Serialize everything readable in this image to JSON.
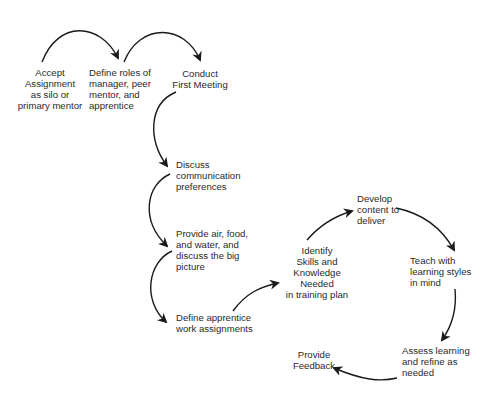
{
  "diagram": {
    "type": "process-flow",
    "line_color": "#1a1a1a",
    "nodes": [
      {
        "id": "accept",
        "label": "Accept\nAssignment\nas silo or\nprimary mentor"
      },
      {
        "id": "define-roles",
        "label": "Define roles of\nmanager, peer\nmentor, and\napprentice"
      },
      {
        "id": "first-meeting",
        "label": "Conduct\nFirst Meeting"
      },
      {
        "id": "communication",
        "label": "Discuss\ncommunication\npreferences"
      },
      {
        "id": "air-food-water",
        "label": "Provide air, food,\nand water, and\ndiscuss the big\npicture"
      },
      {
        "id": "work-assignments",
        "label": "Define apprentice\nwork assignments"
      },
      {
        "id": "identify-skills",
        "label": "Identify\nSkills and\nKnowledge\nNeeded\nin training plan"
      },
      {
        "id": "develop-content",
        "label": "Develop\ncontent to\ndeliver"
      },
      {
        "id": "teach",
        "label": "Teach with\nlearning styles\nin mind"
      },
      {
        "id": "assess",
        "label": "Assess learning\nand refine as\nneeded"
      },
      {
        "id": "feedback",
        "label": "Provide\nFeedback"
      }
    ],
    "edges": [
      {
        "from": "accept",
        "to": "define-roles"
      },
      {
        "from": "define-roles",
        "to": "first-meeting"
      },
      {
        "from": "first-meeting",
        "to": "communication"
      },
      {
        "from": "communication",
        "to": "air-food-water"
      },
      {
        "from": "air-food-water",
        "to": "work-assignments"
      },
      {
        "from": "work-assignments",
        "to": "identify-skills"
      },
      {
        "from": "identify-skills",
        "to": "develop-content"
      },
      {
        "from": "develop-content",
        "to": "teach"
      },
      {
        "from": "teach",
        "to": "assess"
      },
      {
        "from": "assess",
        "to": "feedback"
      }
    ]
  }
}
